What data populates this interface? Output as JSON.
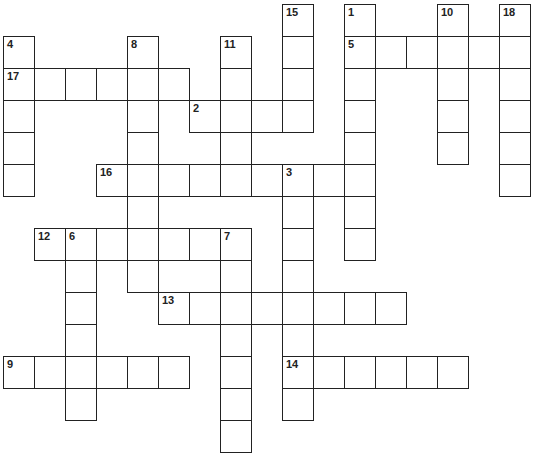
{
  "puzzle": {
    "type": "crossword",
    "cell_width": 31,
    "cell_height": 32,
    "origin_x": 3,
    "origin_y": 4,
    "border_color": "#222222",
    "background": "#ffffff"
  },
  "entries": [
    {
      "number": "1",
      "direction": "down",
      "row": 0,
      "col": 11,
      "length": 8
    },
    {
      "number": "2",
      "direction": "across",
      "row": 3,
      "col": 6,
      "length": 4
    },
    {
      "number": "3",
      "direction": "down",
      "row": 5,
      "col": 9,
      "length": 8
    },
    {
      "number": "4",
      "direction": "down",
      "row": 1,
      "col": 0,
      "length": 5
    },
    {
      "number": "5",
      "direction": "across",
      "row": 1,
      "col": 11,
      "length": 6
    },
    {
      "number": "6",
      "direction": "down",
      "row": 7,
      "col": 2,
      "length": 6
    },
    {
      "number": "7",
      "direction": "down",
      "row": 7,
      "col": 7,
      "length": 7
    },
    {
      "number": "8",
      "direction": "down",
      "row": 1,
      "col": 4,
      "length": 8
    },
    {
      "number": "9",
      "direction": "across",
      "row": 11,
      "col": 0,
      "length": 6
    },
    {
      "number": "10",
      "direction": "down",
      "row": 0,
      "col": 14,
      "length": 5
    },
    {
      "number": "11",
      "direction": "down",
      "row": 1,
      "col": 7,
      "length": 5
    },
    {
      "number": "12",
      "direction": "across",
      "row": 7,
      "col": 1,
      "length": 7
    },
    {
      "number": "13",
      "direction": "across",
      "row": 9,
      "col": 5,
      "length": 8
    },
    {
      "number": "14",
      "direction": "across",
      "row": 11,
      "col": 9,
      "length": 6
    },
    {
      "number": "15",
      "direction": "down",
      "row": 0,
      "col": 9,
      "length": 4
    },
    {
      "number": "16",
      "direction": "across",
      "row": 5,
      "col": 3,
      "length": 9
    },
    {
      "number": "17",
      "direction": "across",
      "row": 2,
      "col": 0,
      "length": 6
    },
    {
      "number": "18",
      "direction": "down",
      "row": 0,
      "col": 16,
      "length": 6
    }
  ]
}
